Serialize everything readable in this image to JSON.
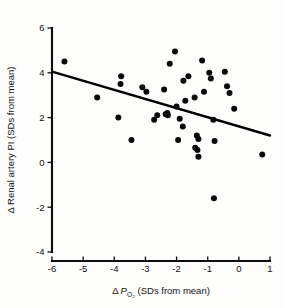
{
  "chart_data": {
    "type": "scatter",
    "title": "",
    "xlabel": "Δ PO2 (SDs from mean)",
    "ylabel": "Δ Renal artery PI (SDs from mean)",
    "xlabel_parts": {
      "delta": "Δ",
      "symbol": "P",
      "subscript": "O₂",
      "suffix": "(SDs from mean)"
    },
    "ylabel_parts": {
      "delta": "Δ",
      "text": "Renal artery PI (SDs from mean)"
    },
    "xlim": [
      -6,
      1
    ],
    "ylim": [
      -4,
      6
    ],
    "xticks": [
      -6,
      -5,
      -4,
      -3,
      -2,
      -1,
      0,
      1
    ],
    "yticks": [
      -4,
      -2,
      0,
      2,
      4,
      6
    ],
    "xtick_labels": [
      "-6",
      "-5",
      "-4",
      "-3",
      "-2",
      "-1",
      "0",
      "1"
    ],
    "ytick_labels": [
      "-4",
      "-2",
      "0",
      "2",
      "4",
      "6"
    ],
    "grid": false,
    "legend": false,
    "marker_color": "#0a0a0a",
    "marker_size": 3.0,
    "line_color": "#000000",
    "trendline": {
      "label": "regression line",
      "x_start": -6,
      "y_start": 4.05,
      "x_end": 1,
      "y_end": 1.2,
      "slope": -0.407,
      "intercept": 1.61
    },
    "points": [
      [
        -5.6,
        4.5
      ],
      [
        -4.55,
        2.9
      ],
      [
        -3.78,
        3.85
      ],
      [
        -3.8,
        3.5
      ],
      [
        -3.87,
        2.0
      ],
      [
        -3.45,
        1.0
      ],
      [
        -3.1,
        3.35
      ],
      [
        -2.97,
        3.15
      ],
      [
        -2.72,
        1.9
      ],
      [
        -2.62,
        2.1
      ],
      [
        -2.4,
        3.25
      ],
      [
        -2.35,
        2.15
      ],
      [
        -2.3,
        2.2
      ],
      [
        -2.28,
        2.1
      ],
      [
        -2.22,
        4.4
      ],
      [
        -2.05,
        4.95
      ],
      [
        -2.0,
        2.5
      ],
      [
        -1.95,
        1.0
      ],
      [
        -1.9,
        1.95
      ],
      [
        -1.78,
        3.65
      ],
      [
        -1.8,
        1.6
      ],
      [
        -1.72,
        2.75
      ],
      [
        -1.62,
        3.85
      ],
      [
        -1.42,
        2.9
      ],
      [
        -1.35,
        1.2
      ],
      [
        -1.3,
        1.05
      ],
      [
        -1.4,
        0.65
      ],
      [
        -1.33,
        0.55
      ],
      [
        -1.3,
        0.25
      ],
      [
        -1.18,
        4.55
      ],
      [
        -1.12,
        3.15
      ],
      [
        -0.95,
        4.0
      ],
      [
        -0.9,
        3.75
      ],
      [
        -0.82,
        1.9
      ],
      [
        -0.78,
        0.95
      ],
      [
        -0.8,
        -1.6
      ],
      [
        -0.45,
        4.05
      ],
      [
        -0.38,
        3.4
      ],
      [
        -0.3,
        3.1
      ],
      [
        -0.15,
        2.4
      ],
      [
        0.75,
        0.35
      ]
    ]
  }
}
